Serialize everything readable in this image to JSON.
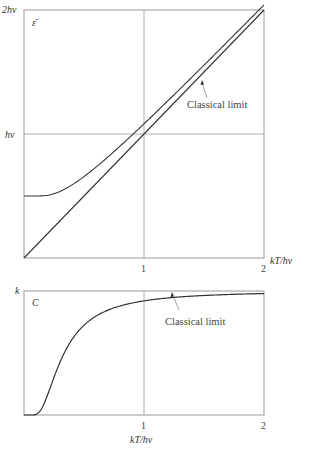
{
  "chart_data": [
    {
      "type": "line",
      "title": "",
      "ylabel": "ε̄",
      "xlabel": "kT/hν",
      "xlim": [
        0,
        2
      ],
      "ylim": [
        0,
        2
      ],
      "y_unit": "hν",
      "x_ticks": [
        "1",
        "2"
      ],
      "y_ticks": [
        "hν",
        "2hν"
      ],
      "grid": "lines at x=1 and y=hν",
      "annotation": "Classical limit",
      "series": [
        {
          "name": "Quantum oscillator mean energy (ε̄/hν)",
          "x": [
            0,
            0.1,
            0.2,
            0.3,
            0.4,
            0.5,
            0.6,
            0.7,
            0.8,
            1.0,
            1.2,
            1.4,
            1.6,
            1.8,
            2.0
          ],
          "values": [
            0.5,
            0.5,
            0.503,
            0.518,
            0.542,
            0.579,
            0.624,
            0.673,
            0.727,
            0.849,
            0.976,
            1.098,
            1.227,
            1.35,
            1.48
          ]
        },
        {
          "name": "Classical limit (ε̄ = kT)",
          "x": [
            0,
            2
          ],
          "values": [
            0,
            2
          ]
        }
      ]
    },
    {
      "type": "line",
      "title": "",
      "ylabel": "C",
      "xlabel": "kT/hν",
      "xlim": [
        0,
        2
      ],
      "ylim": [
        0,
        1
      ],
      "y_unit": "k",
      "x_ticks": [
        "1",
        "2"
      ],
      "y_ticks": [
        "k"
      ],
      "grid": "line at x=1",
      "annotation": "Classical limit",
      "series": [
        {
          "name": "Einstein heat capacity (C/k)",
          "x": [
            0,
            0.05,
            0.1,
            0.15,
            0.2,
            0.25,
            0.3,
            0.4,
            0.5,
            0.6,
            0.7,
            0.8,
            1.0,
            1.2,
            1.5,
            2.0
          ],
          "values": [
            0,
            0.0,
            0.005,
            0.058,
            0.171,
            0.304,
            0.42,
            0.6,
            0.724,
            0.797,
            0.845,
            0.879,
            0.921,
            0.944,
            0.964,
            0.979
          ]
        },
        {
          "name": "Classical limit (C = k)",
          "x": [
            0,
            2
          ],
          "values": [
            1,
            1
          ]
        }
      ]
    }
  ],
  "top": {
    "y_label_top": "2hν",
    "y_label_mid": "hν",
    "axis_symbol": "ε̄",
    "x_tick_1": "1",
    "x_tick_2": "2",
    "x_axis_label": "kT/hν",
    "annotation": "Classical limit"
  },
  "bottom": {
    "y_label_top": "k",
    "axis_symbol": "C",
    "x_tick_1": "1",
    "x_tick_2": "2",
    "x_axis_label": "kT/hν",
    "annotation": "Classical limit"
  },
  "colors": {
    "frame": "#9a9a9a",
    "curve": "#333333"
  }
}
